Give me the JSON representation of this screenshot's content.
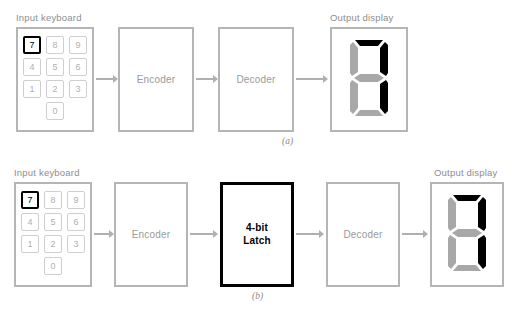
{
  "figure": {
    "panels": [
      {
        "id": "a",
        "label": "(a)",
        "keyboard": {
          "caption": "Input keyboard",
          "rows": [
            [
              "7",
              "8",
              "9"
            ],
            [
              "4",
              "5",
              "6"
            ],
            [
              "1",
              "2",
              "3"
            ],
            [
              "0"
            ]
          ],
          "selected_key": "7"
        },
        "blocks": [
          {
            "name": "encoder",
            "label": "Encoder",
            "emphasis": "normal"
          },
          {
            "name": "decoder",
            "label": "Decoder",
            "emphasis": "normal"
          }
        ],
        "display": {
          "caption": "Output display",
          "value": "7",
          "segments_on": [
            "a",
            "b",
            "c"
          ],
          "segments_off": [
            "d",
            "e",
            "f",
            "g"
          ]
        }
      },
      {
        "id": "b",
        "label": "(b)",
        "keyboard": {
          "caption": "Input keyboard",
          "rows": [
            [
              "7",
              "8",
              "9"
            ],
            [
              "4",
              "5",
              "6"
            ],
            [
              "1",
              "2",
              "3"
            ],
            [
              "0"
            ]
          ],
          "selected_key": "7"
        },
        "blocks": [
          {
            "name": "encoder",
            "label": "Encoder",
            "emphasis": "normal"
          },
          {
            "name": "latch",
            "label_line1": "4-bit",
            "label_line2": "Latch",
            "emphasis": "strong"
          },
          {
            "name": "decoder",
            "label": "Decoder",
            "emphasis": "normal"
          }
        ],
        "display": {
          "caption": "Output display",
          "value": "7",
          "segments_on": [
            "a",
            "b",
            "c"
          ],
          "segments_off": [
            "d",
            "e",
            "f",
            "g"
          ]
        }
      }
    ],
    "colors": {
      "outline_gray": "#b5b5b5",
      "text_gray": "#9a9a9a",
      "key_gray": "#cfcfcf",
      "arrow_gray": "#b0b0b0",
      "segment_on": "#000000",
      "segment_off": "#a8a8a8",
      "emphasis_black": "#000000",
      "background": "#ffffff"
    }
  }
}
